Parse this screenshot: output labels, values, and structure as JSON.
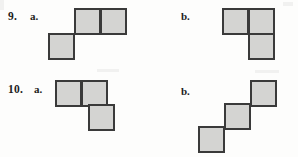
{
  "page": {
    "background_color": "#fdfdfc",
    "square_fill_color": "#d4d4d2",
    "square_border_color": "#3a3a3a",
    "text_color": "#1d1d1d"
  },
  "problems": [
    {
      "number_label": "9.",
      "number_x": 8,
      "number_y": 11,
      "parts": [
        {
          "part_label": "a.",
          "label_x": 30,
          "label_y": 11,
          "figure_name": "figure-9a",
          "cell_size": 27,
          "cells": [
            {
              "x": 74,
              "y": 8
            },
            {
              "x": 100,
              "y": 8
            },
            {
              "x": 48,
              "y": 33
            }
          ]
        },
        {
          "part_label": "b.",
          "label_x": 181,
          "label_y": 11,
          "figure_name": "figure-9b",
          "cell_size": 27,
          "cells": [
            {
              "x": 222,
              "y": 8
            },
            {
              "x": 248,
              "y": 8
            },
            {
              "x": 248,
              "y": 33
            }
          ]
        }
      ]
    },
    {
      "number_label": "10.",
      "number_x": 8,
      "number_y": 84,
      "parts": [
        {
          "part_label": "a.",
          "label_x": 34,
          "label_y": 84,
          "figure_name": "figure-10a",
          "cell_size": 27,
          "cells": [
            {
              "x": 55,
              "y": 80
            },
            {
              "x": 81,
              "y": 80
            },
            {
              "x": 88,
              "y": 104
            }
          ]
        },
        {
          "part_label": "b.",
          "label_x": 181,
          "label_y": 86,
          "figure_name": "figure-10b",
          "cell_size": 27,
          "cells": [
            {
              "x": 198,
              "y": 126
            },
            {
              "x": 224,
              "y": 103
            },
            {
              "x": 250,
              "y": 80
            }
          ]
        }
      ]
    }
  ]
}
